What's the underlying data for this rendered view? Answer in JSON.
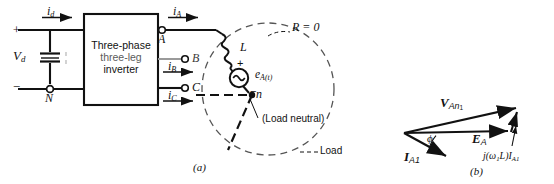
{
  "figure": {
    "part_a_caption": "(a)",
    "part_b_caption": "(b)"
  },
  "circuit": {
    "dc_source_label": "V",
    "dc_source_sub": "d",
    "plus_sign": "+",
    "minus_sign": "−",
    "neutral_node": "N",
    "input_current": "i",
    "input_current_sub": "d",
    "inverter_line1": "Three-phase",
    "inverter_line2": "three-leg",
    "inverter_line3": "inverter",
    "terminal_a": "A",
    "terminal_b": "B",
    "terminal_c": "C",
    "current_a": "i",
    "current_a_sub": "A",
    "current_b": "i",
    "current_b_sub": "B",
    "current_c": "i",
    "current_c_sub": "C"
  },
  "load": {
    "resistance_label": "R = 0",
    "inductance_label": "L",
    "source_label": "e",
    "source_sub": "A(t)",
    "source_plus": "+",
    "source_minus": "−",
    "neutral_node": "n",
    "neutral_note": "(Load neutral)",
    "load_label": "Load"
  },
  "phasor": {
    "voltage_label": "V",
    "voltage_sub": "An",
    "voltage_sub_num": "1",
    "emf_label": "E",
    "emf_sub": "A",
    "current_label": "I",
    "current_sub": "A1",
    "angle_label": "ϕ",
    "reactance_label": "j(ω",
    "reactance_sub1": "1",
    "reactance_label2": "L)I",
    "reactance_sub2": "A1"
  },
  "colors": {
    "ink": "#111111",
    "faint": "#9a9a9a",
    "paper": "#ffffff"
  }
}
